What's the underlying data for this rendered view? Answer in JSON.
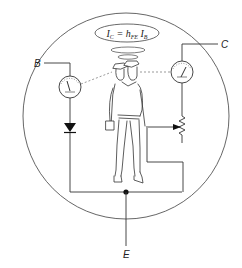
{
  "diagram": {
    "title_formula": {
      "lhs": "I",
      "lhs_sub": "C",
      "eq": " = ",
      "gain": "h",
      "gain_sub": "FE",
      "rhs": "I",
      "rhs_sub": "B"
    },
    "terminals": {
      "base": "B",
      "collector": "C",
      "emitter": "E"
    },
    "components": [
      {
        "name": "base-current-meter",
        "type": "ammeter"
      },
      {
        "name": "collector-current-meter",
        "type": "ammeter"
      },
      {
        "name": "base-diode",
        "type": "diode"
      },
      {
        "name": "collector-variable-resistor",
        "type": "potentiometer"
      },
      {
        "name": "transistor-operator-figure",
        "type": "illustration"
      }
    ],
    "colors": {
      "line": "#333333",
      "background": "#ffffff"
    }
  }
}
